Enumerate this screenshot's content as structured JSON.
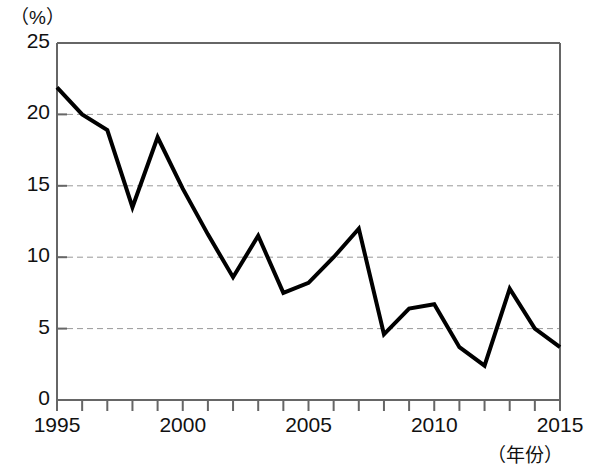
{
  "chart_data": {
    "type": "line",
    "title": "",
    "subtitle": "",
    "xlabel": "（年份）",
    "ylabel": "（%）",
    "xlim": [
      1995,
      2015
    ],
    "ylim": [
      0,
      25
    ],
    "grid": "horizontal-dashed",
    "legend": "none",
    "x": [
      1995,
      1996,
      1997,
      1998,
      1999,
      2000,
      2001,
      2002,
      2003,
      2004,
      2005,
      2006,
      2007,
      2008,
      2009,
      2010,
      2011,
      2012,
      2013,
      2014,
      2015
    ],
    "values": [
      21.9,
      20.0,
      18.9,
      13.5,
      18.4,
      14.8,
      11.6,
      8.6,
      11.5,
      7.5,
      8.2,
      10.0,
      12.0,
      4.6,
      6.4,
      6.7,
      3.7,
      2.4,
      7.8,
      5.0,
      3.7
    ],
    "series": [
      {
        "name": "",
        "color": "#000000",
        "values": [
          21.9,
          20.0,
          18.9,
          13.5,
          18.4,
          14.8,
          11.6,
          8.6,
          11.5,
          7.5,
          8.2,
          10.0,
          12.0,
          4.6,
          6.4,
          6.7,
          3.7,
          2.4,
          7.8,
          5.0,
          3.7
        ]
      }
    ],
    "y_ticks": [
      0,
      5,
      10,
      15,
      20,
      25
    ],
    "y_tick_labels": [
      "0",
      "5",
      "10",
      "15",
      "20",
      "25"
    ],
    "x_ticks": [
      1995,
      1996,
      1997,
      1998,
      1999,
      2000,
      2001,
      2002,
      2003,
      2004,
      2005,
      2006,
      2007,
      2008,
      2009,
      2010,
      2011,
      2012,
      2013,
      2014,
      2015
    ],
    "x_tick_labels_shown": [
      "1995",
      "2000",
      "2005",
      "2010",
      "2015"
    ],
    "x_tick_label_years": [
      1995,
      2000,
      2005,
      2010,
      2015
    ],
    "line_color": "#000000",
    "line_width": 4,
    "grid_color": "#999999",
    "frame_color": "#666666",
    "background": "#ffffff"
  }
}
